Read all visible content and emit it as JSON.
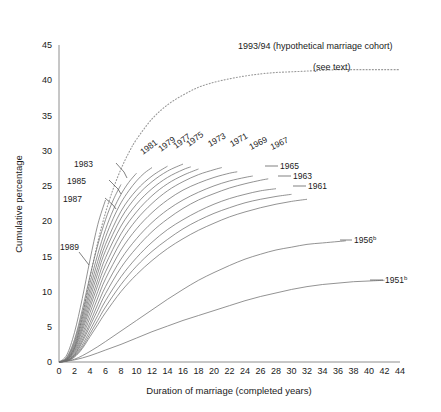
{
  "chart_data": {
    "type": "line",
    "title": "",
    "xlabel": "Duration of marriage (completed years)",
    "ylabel": "Cumulative percentage",
    "xlim": [
      0,
      44
    ],
    "ylim": [
      0,
      45
    ],
    "xticks": [
      0,
      2,
      4,
      6,
      8,
      10,
      12,
      14,
      16,
      18,
      20,
      22,
      24,
      26,
      28,
      30,
      32,
      34,
      36,
      38,
      40,
      42,
      44
    ],
    "yticks": [
      0,
      5,
      10,
      15,
      20,
      25,
      30,
      35,
      40,
      45
    ],
    "grid": false,
    "legend": "inline-labels",
    "annotations": [
      "1993/94 (hypothetical marriage cohort)",
      "(see text)"
    ],
    "series": [
      {
        "name": "1993/94",
        "label": "1993/94 (hypothetical marriage cohort)",
        "style": "dotted",
        "x": [
          0,
          1,
          2,
          3,
          4,
          5,
          6,
          7,
          8,
          9,
          10,
          12,
          14,
          16,
          18,
          20,
          22,
          24,
          26,
          28,
          30,
          32,
          34,
          36,
          38,
          40,
          42,
          44
        ],
        "y": [
          0,
          0.3,
          2.0,
          6.5,
          12.0,
          17.0,
          21.2,
          24.6,
          27.4,
          29.7,
          31.6,
          34.5,
          36.5,
          37.9,
          39.0,
          39.7,
          40.2,
          40.6,
          40.9,
          41.1,
          41.2,
          41.3,
          41.4,
          41.5,
          41.5,
          41.5,
          41.5,
          41.5
        ]
      },
      {
        "name": "1989",
        "label": "1989",
        "style": "solid",
        "x": [
          0,
          1,
          2,
          3,
          4,
          5,
          6
        ],
        "y": [
          0,
          1.0,
          4.2,
          9.0,
          14.5,
          19.5,
          23.0
        ]
      },
      {
        "name": "1987",
        "label": "1987",
        "style": "solid",
        "x": [
          0,
          1,
          2,
          3,
          4,
          5,
          6,
          7,
          8
        ],
        "y": [
          0,
          0.7,
          3.2,
          7.4,
          12.2,
          16.6,
          20.2,
          23.0,
          25.2
        ]
      },
      {
        "name": "1985",
        "label": "1985",
        "style": "solid",
        "x": [
          0,
          1,
          2,
          3,
          4,
          5,
          6,
          7,
          8,
          9,
          10
        ],
        "y": [
          0,
          0.6,
          2.9,
          6.8,
          11.2,
          15.3,
          18.8,
          21.6,
          23.8,
          25.5,
          26.8
        ]
      },
      {
        "name": "1983",
        "label": "1983",
        "style": "solid",
        "x": [
          0,
          1,
          2,
          3,
          4,
          5,
          6,
          7,
          8,
          9,
          10,
          11,
          12
        ],
        "y": [
          0,
          0.5,
          2.6,
          6.2,
          10.4,
          14.3,
          17.7,
          20.4,
          22.6,
          24.3,
          25.7,
          26.8,
          27.6
        ]
      },
      {
        "name": "1981",
        "label": "1981",
        "style": "solid",
        "x": [
          0,
          1,
          2,
          3,
          4,
          5,
          6,
          8,
          10,
          12,
          14
        ],
        "y": [
          0,
          0.4,
          2.3,
          5.7,
          9.7,
          13.4,
          16.7,
          21.4,
          24.4,
          26.4,
          27.8
        ]
      },
      {
        "name": "1979",
        "label": "1979",
        "style": "solid",
        "x": [
          0,
          1,
          2,
          3,
          4,
          5,
          6,
          8,
          10,
          12,
          14,
          16
        ],
        "y": [
          0,
          0.4,
          2.1,
          5.2,
          9.0,
          12.6,
          15.8,
          20.4,
          23.5,
          25.6,
          27.1,
          28.1
        ]
      },
      {
        "name": "1977",
        "label": "1977",
        "style": "solid",
        "x": [
          0,
          1,
          2,
          3,
          4,
          5,
          6,
          8,
          10,
          12,
          14,
          16,
          17
        ],
        "y": [
          0,
          0.35,
          1.9,
          4.8,
          8.3,
          11.7,
          14.8,
          19.3,
          22.4,
          24.6,
          26.2,
          27.3,
          27.7
        ]
      },
      {
        "name": "1975",
        "label": "1975",
        "style": "solid",
        "x": [
          0,
          1,
          2,
          3,
          4,
          5,
          6,
          8,
          10,
          12,
          14,
          16,
          18
        ],
        "y": [
          0,
          0.3,
          1.7,
          4.4,
          7.7,
          10.9,
          13.8,
          18.2,
          21.3,
          23.6,
          25.3,
          26.5,
          27.4
        ]
      },
      {
        "name": "1973",
        "label": "1973",
        "style": "solid",
        "x": [
          0,
          1,
          2,
          3,
          4,
          5,
          6,
          8,
          10,
          12,
          14,
          16,
          18,
          20,
          21
        ],
        "y": [
          0,
          0.3,
          1.5,
          3.9,
          7.0,
          10.0,
          12.8,
          17.1,
          20.2,
          22.5,
          24.3,
          25.6,
          26.6,
          27.3,
          27.6
        ]
      },
      {
        "name": "1971",
        "label": "1971",
        "style": "solid",
        "x": [
          0,
          1,
          2,
          3,
          4,
          5,
          6,
          8,
          10,
          12,
          14,
          16,
          18,
          20,
          22,
          23
        ],
        "y": [
          0,
          0.25,
          1.3,
          3.5,
          6.3,
          9.1,
          11.8,
          15.9,
          18.9,
          21.2,
          23.0,
          24.4,
          25.4,
          26.2,
          26.8,
          27.0
        ]
      },
      {
        "name": "1969",
        "label": "1969",
        "style": "solid",
        "x": [
          0,
          1,
          2,
          3,
          4,
          5,
          6,
          8,
          10,
          12,
          14,
          16,
          18,
          20,
          22,
          24,
          25
        ],
        "y": [
          0,
          0.2,
          1.1,
          3.1,
          5.6,
          8.2,
          10.7,
          14.6,
          17.5,
          19.8,
          21.6,
          23.0,
          24.1,
          25.0,
          25.7,
          26.2,
          26.4
        ]
      },
      {
        "name": "1967",
        "label": "1967",
        "style": "solid",
        "x": [
          0,
          1,
          2,
          3,
          4,
          5,
          6,
          8,
          10,
          12,
          14,
          16,
          18,
          20,
          22,
          24,
          26,
          27
        ],
        "y": [
          0,
          0.2,
          1.0,
          2.8,
          5.1,
          7.4,
          9.7,
          13.4,
          16.2,
          18.5,
          20.3,
          21.8,
          23.0,
          23.9,
          24.7,
          25.3,
          25.8,
          26.0
        ]
      },
      {
        "name": "1965",
        "label": "1965",
        "style": "solid",
        "x": [
          0,
          1,
          2,
          3,
          4,
          5,
          6,
          8,
          10,
          12,
          14,
          16,
          18,
          20,
          22,
          24,
          26,
          28
        ],
        "y": [
          0,
          0.18,
          0.9,
          2.4,
          4.5,
          6.6,
          8.7,
          12.1,
          14.8,
          17.0,
          18.8,
          20.2,
          21.4,
          22.4,
          23.2,
          23.8,
          24.3,
          24.6
        ]
      },
      {
        "name": "1963",
        "label": "1963",
        "style": "solid",
        "x": [
          0,
          1,
          2,
          3,
          4,
          5,
          6,
          8,
          10,
          12,
          14,
          16,
          18,
          20,
          22,
          24,
          26,
          28,
          30
        ],
        "y": [
          0,
          0.15,
          0.8,
          2.1,
          4.0,
          5.9,
          7.8,
          11.0,
          13.6,
          15.7,
          17.4,
          18.9,
          20.1,
          21.1,
          21.9,
          22.6,
          23.1,
          23.5,
          23.8
        ]
      },
      {
        "name": "1961",
        "label": "1961",
        "style": "solid",
        "x": [
          0,
          1,
          2,
          3,
          4,
          5,
          6,
          8,
          10,
          12,
          14,
          16,
          18,
          20,
          22,
          24,
          26,
          28,
          30,
          32
        ],
        "y": [
          0,
          0.12,
          0.7,
          1.9,
          3.6,
          5.3,
          7.0,
          10.0,
          12.4,
          14.4,
          16.1,
          17.5,
          18.7,
          19.7,
          20.6,
          21.3,
          21.9,
          22.4,
          22.8,
          23.1
        ]
      },
      {
        "name": "1956",
        "label": "1956",
        "superscript": "b",
        "style": "solid",
        "x": [
          0,
          2,
          4,
          6,
          8,
          10,
          12,
          14,
          16,
          18,
          20,
          22,
          24,
          26,
          28,
          30,
          32,
          34,
          36,
          37
        ],
        "y": [
          0,
          0.4,
          1.5,
          2.9,
          4.4,
          5.9,
          7.4,
          8.9,
          10.3,
          11.6,
          12.7,
          13.7,
          14.6,
          15.3,
          15.9,
          16.3,
          16.7,
          16.9,
          17.1,
          17.2
        ]
      },
      {
        "name": "1951",
        "label": "1951",
        "superscript": "b",
        "style": "solid",
        "x": [
          0,
          2,
          4,
          6,
          8,
          10,
          12,
          14,
          16,
          18,
          20,
          22,
          24,
          26,
          28,
          30,
          32,
          34,
          36,
          38,
          40,
          42
        ],
        "y": [
          0,
          0.3,
          0.9,
          1.7,
          2.5,
          3.4,
          4.3,
          5.1,
          5.9,
          6.6,
          7.3,
          8.0,
          8.7,
          9.3,
          9.8,
          10.3,
          10.7,
          11.0,
          11.2,
          11.4,
          11.5,
          11.6
        ]
      }
    ]
  },
  "labels": {
    "y_axis_title": "Cumulative percentage",
    "x_axis_title": "Duration of marriage (completed years)",
    "cohort_1993": "1993/94 (hypothetical marriage cohort)",
    "see_text": "(see text)",
    "sup_b": "b"
  },
  "colors": {
    "axis": "#8e8e8e",
    "curve": "#6f6f6f",
    "dotted_curve": "#9a9a9a",
    "text": "#1a1a1a",
    "background": "#ffffff"
  }
}
